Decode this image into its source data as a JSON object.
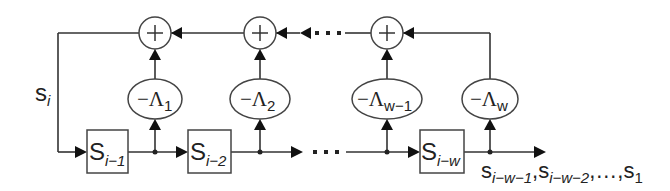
{
  "diagram": {
    "title": "",
    "type": "linear feedback shift register / recursive filter",
    "input_label": {
      "main": "s",
      "sub": "i"
    },
    "registers": [
      {
        "main": "S",
        "sub": "i−1"
      },
      {
        "main": "S",
        "sub": "i−2"
      },
      {
        "main": "S",
        "sub": "i−w"
      }
    ],
    "coefficients": [
      {
        "prefix": "−Λ",
        "sub": "1"
      },
      {
        "prefix": "−Λ",
        "sub": "2"
      },
      {
        "prefix": "−Λ",
        "sub": "w−1"
      },
      {
        "prefix": "−Λ",
        "sub": "w"
      }
    ],
    "adders": [
      "+",
      "+",
      "+"
    ],
    "ellipsis": "· · ·",
    "output_label": {
      "parts": [
        {
          "main": "s",
          "sub": "i−w−1"
        },
        {
          "sep": ","
        },
        {
          "main": "s",
          "sub": "i−w−2"
        },
        {
          "sep": ",…,"
        },
        {
          "main": "s",
          "sub": "1"
        }
      ]
    }
  }
}
